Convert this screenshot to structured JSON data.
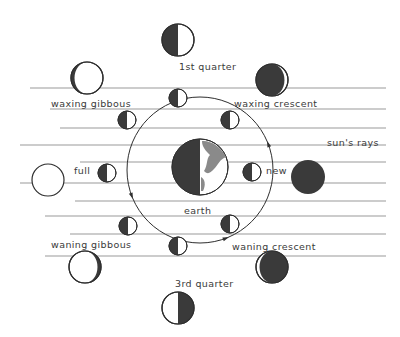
{
  "colors": {
    "background": "#ffffff",
    "ink": "#2e2e2e",
    "dark": "#3a3a3a",
    "ray": "#9a9a9a",
    "land": "#8a8a8a",
    "light": "#ffffff"
  },
  "labels": {
    "first_quarter": "1st quarter",
    "waxing_crescent": "waxing crescent",
    "waxing_gibbous": "waxing gibbous",
    "full": "full",
    "new": "new",
    "earth": "earth",
    "suns_rays": "sun's rays",
    "waning_gibbous": "waning gibbous",
    "waning_crescent": "waning crescent",
    "third_quarter": "3rd quarter"
  },
  "rays": [
    {
      "y": 88,
      "x1": 30,
      "x2": 386
    },
    {
      "y": 109,
      "x1": 50,
      "x2": 386
    },
    {
      "y": 128,
      "x1": 60,
      "x2": 386
    },
    {
      "y": 145,
      "x1": 20,
      "x2": 386
    },
    {
      "y": 162,
      "x1": 80,
      "x2": 386
    },
    {
      "y": 183,
      "x1": 20,
      "x2": 386
    },
    {
      "y": 201,
      "x1": 75,
      "x2": 386
    },
    {
      "y": 216,
      "x1": 45,
      "x2": 386
    },
    {
      "y": 234,
      "x1": 70,
      "x2": 386
    },
    {
      "y": 256,
      "x1": 45,
      "x2": 386
    }
  ],
  "orbit": {
    "cx": 200,
    "cy": 170,
    "r": 73,
    "direction": "counter-clockwise"
  },
  "earth": {
    "cx": 200,
    "cy": 167,
    "r": 28
  },
  "orbit_moons": [
    {
      "name": "orbit-moon-top",
      "cx": 178,
      "cy": 98
    },
    {
      "name": "orbit-moon-top-right",
      "cx": 230,
      "cy": 120
    },
    {
      "name": "orbit-moon-right",
      "cx": 252,
      "cy": 172
    },
    {
      "name": "orbit-moon-bottom-right",
      "cx": 230,
      "cy": 224
    },
    {
      "name": "orbit-moon-bottom",
      "cx": 178,
      "cy": 246
    },
    {
      "name": "orbit-moon-bottom-left",
      "cx": 128,
      "cy": 226
    },
    {
      "name": "orbit-moon-left",
      "cx": 107,
      "cy": 173
    },
    {
      "name": "orbit-moon-top-left",
      "cx": 127,
      "cy": 120
    }
  ],
  "phases": [
    {
      "id": "first_quarter",
      "cx": 178,
      "cy": 40,
      "r": 16
    },
    {
      "id": "waxing_crescent",
      "cx": 272,
      "cy": 80,
      "r": 16
    },
    {
      "id": "waxing_gibbous",
      "cx": 87,
      "cy": 78,
      "r": 16
    },
    {
      "id": "full",
      "cx": 48,
      "cy": 180,
      "r": 16
    },
    {
      "id": "new",
      "cx": 308,
      "cy": 177,
      "r": 17
    },
    {
      "id": "waning_gibbous",
      "cx": 85,
      "cy": 267,
      "r": 16
    },
    {
      "id": "waning_crescent",
      "cx": 272,
      "cy": 267,
      "r": 16
    },
    {
      "id": "third_quarter",
      "cx": 178,
      "cy": 308,
      "r": 16
    }
  ]
}
